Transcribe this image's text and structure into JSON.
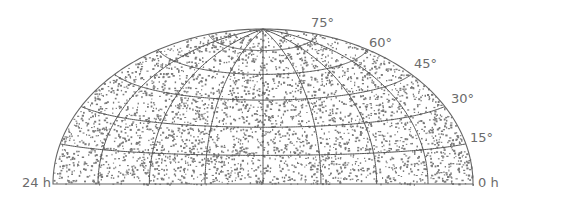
{
  "chart_data": {
    "type": "scatter",
    "title": "",
    "projection": "hammer-aitoff (northern hemisphere only)",
    "xlabel": "Right ascension",
    "ylabel": "Declination",
    "x_tick_labels": [
      "24 h",
      "0 h"
    ],
    "y_tick_labels": [
      "15°",
      "30°",
      "45°",
      "60°",
      "75°"
    ],
    "declination_parallels_deg": [
      15,
      30,
      45,
      60,
      75
    ],
    "ra_meridians_hours": [
      0,
      3,
      6,
      9,
      12,
      15,
      18,
      21,
      24
    ],
    "xlim_hours": [
      24,
      0
    ],
    "ylim_deg": [
      0,
      90
    ],
    "grid": true,
    "legend": null,
    "point_count_estimate": 3500,
    "point_color": "#7a7a7a",
    "grid_color": "#555555"
  },
  "labels": {
    "ra_left": "24 h",
    "ra_right": "0 h",
    "dec_15": "15°",
    "dec_30": "30°",
    "dec_45": "45°",
    "dec_60": "60°",
    "dec_75": "75°"
  }
}
